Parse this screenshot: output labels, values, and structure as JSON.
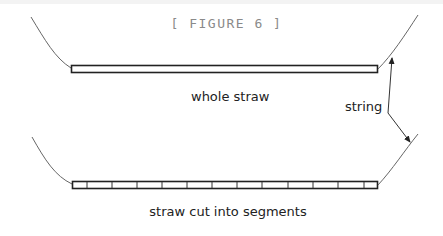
{
  "figure": {
    "title": "[ FIGURE 6 ]",
    "labels": {
      "whole_straw": "whole straw",
      "string": "string",
      "segmented_straw": "straw cut into segments"
    },
    "colors": {
      "line": "#222222",
      "string_line": "#555555",
      "title": "#8a8a8a"
    },
    "top_straw": {
      "x_start": 71,
      "x_end": 378,
      "segments": 1
    },
    "bottom_straw": {
      "x_start": 72,
      "x_end": 378,
      "segments": 13,
      "divider_x": [
        87,
        112,
        137,
        162,
        187,
        212,
        237,
        262,
        288,
        313,
        338,
        364
      ]
    }
  }
}
